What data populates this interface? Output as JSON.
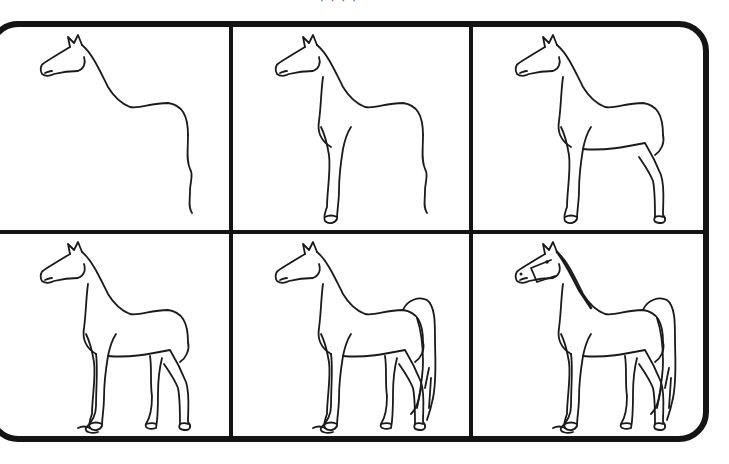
{
  "title_fragment": "· · · ·",
  "sheet": {
    "type": "step-by-step drawing guide",
    "subject": "horse",
    "layout": {
      "rows": 2,
      "columns": 3
    },
    "frame_color": "#141414",
    "line_color": "#1a1a1a",
    "background": "#ffffff"
  },
  "steps": [
    {
      "step": 1,
      "description": "Head outline, ears, neck and back line with hind leg contour"
    },
    {
      "step": 2,
      "description": "Add chest and front leg with hoof"
    },
    {
      "step": 3,
      "description": "Add belly line, hind leg and rear hoof"
    },
    {
      "step": 4,
      "description": "Add second front leg and second hind leg"
    },
    {
      "step": 5,
      "description": "Add flowing tail"
    },
    {
      "step": 6,
      "description": "Add mane, eye, nostril and halter details"
    }
  ]
}
